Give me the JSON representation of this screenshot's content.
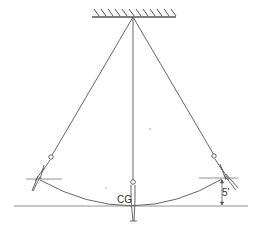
{
  "diagram": {
    "labels": {
      "center_of_gravity": "CG",
      "height_difference": "5'"
    },
    "elements": {
      "ceiling": "hatched fixed support",
      "ropes": 3,
      "figures": [
        "left swing position",
        "center rest position",
        "right swing position"
      ],
      "arc": "path of center of gravity",
      "reference_lines": [
        "ground line",
        "left horizontal marker",
        "right horizontal marker"
      ]
    },
    "colors": {
      "line": "#555555",
      "background": "#ffffff"
    }
  }
}
